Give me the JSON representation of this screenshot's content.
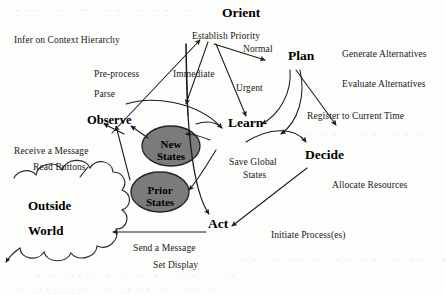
{
  "diagram": {
    "canvas": {
      "width": 446,
      "height": 295,
      "background": "#fdfdfc"
    },
    "colors": {
      "stroke": "#1a1a1a",
      "text": "#111111",
      "ellipse_fill": "#7b7b7b",
      "ellipse_stroke": "#222222",
      "cloud_stroke": "#2a2a2a",
      "noise_text": "#d8d7d3"
    },
    "nodes": [
      {
        "id": "orient",
        "label": "Orient",
        "x": 222,
        "y": 14,
        "size": "lg"
      },
      {
        "id": "plan",
        "label": "Plan",
        "x": 288,
        "y": 57,
        "size": "lg"
      },
      {
        "id": "learn",
        "label": "Learn",
        "x": 228,
        "y": 124,
        "size": "lg"
      },
      {
        "id": "decide",
        "label": "Decide",
        "x": 305,
        "y": 156,
        "size": "lg"
      },
      {
        "id": "act",
        "label": "Act",
        "x": 208,
        "y": 225,
        "size": "lg"
      },
      {
        "id": "observe",
        "label": "Observe",
        "x": 87,
        "y": 121,
        "size": "md"
      }
    ],
    "ellipses": [
      {
        "id": "new-states",
        "lines": [
          "New",
          "States"
        ],
        "cx": 171,
        "cy": 146,
        "rx": 29,
        "ry": 20
      },
      {
        "id": "prior-states",
        "lines": [
          "Prior",
          "States"
        ],
        "cx": 160,
        "cy": 192,
        "rx": 29,
        "ry": 20
      }
    ],
    "cloud": {
      "id": "outside-world",
      "lines": [
        "Outside",
        "World"
      ],
      "label_x": 28,
      "label_y": 205
    },
    "edge_labels": [
      {
        "id": "infer-on-context-hierarchy",
        "text": "Infer on Context Hierarchy",
        "x": 14,
        "y": 36
      },
      {
        "id": "establish-priority",
        "text": "Establish Priority",
        "x": 192,
        "y": 32
      },
      {
        "id": "normal",
        "text": "Normal",
        "x": 243,
        "y": 45
      },
      {
        "id": "generate-alternatives",
        "text": "Generate Alternatives",
        "x": 342,
        "y": 50
      },
      {
        "id": "pre-process",
        "text": "Pre-process",
        "x": 94,
        "y": 70
      },
      {
        "id": "immediate",
        "text": "Immediate",
        "x": 173,
        "y": 70
      },
      {
        "id": "urgent",
        "text": "Urgent",
        "x": 236,
        "y": 84
      },
      {
        "id": "evaluate-alternatives",
        "text": "Evaluate Alternatives",
        "x": 342,
        "y": 80
      },
      {
        "id": "parse",
        "text": "Parse",
        "x": 94,
        "y": 90
      },
      {
        "id": "register-to-current-time",
        "text": "Register to Current Time",
        "x": 307,
        "y": 112
      },
      {
        "id": "receive-a-message",
        "text": "Receive a Message",
        "x": 14,
        "y": 147
      },
      {
        "id": "save-global",
        "text": "Save Global",
        "x": 229,
        "y": 158
      },
      {
        "id": "read-buttons",
        "text": "Read Buttons",
        "x": 33,
        "y": 163
      },
      {
        "id": "states-label",
        "text": "States",
        "x": 243,
        "y": 171
      },
      {
        "id": "allocate-resources",
        "text": "Allocate Resources",
        "x": 332,
        "y": 181
      },
      {
        "id": "initiate-processes",
        "text": "Initiate Process(es)",
        "x": 271,
        "y": 231
      },
      {
        "id": "send-a-message",
        "text": "Send a Message",
        "x": 133,
        "y": 244
      },
      {
        "id": "set-display",
        "text": "Set Display",
        "x": 153,
        "y": 261
      }
    ],
    "scan_artifacts": [
      {
        "id": "noise-top",
        "text": "· - ·· - ·· ··· · -· ·· ·· - ·· ··· ·· -·  · ···",
        "x": 8,
        "y": 6
      },
      {
        "id": "noise-mid-right",
        "text": "·· ··· - · ·· ·· - · ··· -· ··",
        "x": 304,
        "y": 130
      },
      {
        "id": "noise-bottom-a",
        "text": "·· - · ··· · -·· ··· ·· - ··· ·· -· · ··· - ·· ·· -",
        "x": 240,
        "y": 256
      },
      {
        "id": "noise-bottom-b",
        "text": "· -· ·· ··· - ·· · -· ··· ·· · - ·· ··· -· · · ·· -",
        "x": 30,
        "y": 272
      },
      {
        "id": "noise-bottom-c",
        "text": "·· ··· - ·· ·· -· ·· ··· · - ·· - ··· ·· ·· -· ···",
        "x": 18,
        "y": 285
      }
    ]
  }
}
